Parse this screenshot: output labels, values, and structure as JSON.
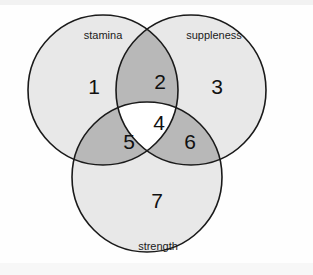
{
  "diagram": {
    "type": "venn-3-set",
    "background_color": "#fefefe",
    "stroke_color": "#1a1a1a",
    "fill_single": "#e8e8e8",
    "fill_double": "#b8b8b8",
    "fill_triple": "#ffffff",
    "sets": [
      {
        "id": "stamina",
        "label": "stamina",
        "cx": 103,
        "cy": 90,
        "r": 75,
        "label_x": 103,
        "label_y": 36
      },
      {
        "id": "suppleness",
        "label": "suppleness",
        "cx": 191,
        "cy": 90,
        "r": 75,
        "label_x": 214,
        "label_y": 36
      },
      {
        "id": "strength",
        "label": "strength",
        "cx": 147,
        "cy": 177,
        "r": 75,
        "label_x": 158,
        "label_y": 247
      }
    ],
    "regions": [
      {
        "id": "stamina-only",
        "number": "1",
        "x": 94,
        "y": 88,
        "shade": "single"
      },
      {
        "id": "stamina-suppleness",
        "number": "2",
        "x": 160,
        "y": 83,
        "shade": "double"
      },
      {
        "id": "suppleness-only",
        "number": "3",
        "x": 217,
        "y": 88,
        "shade": "single"
      },
      {
        "id": "stamina-suppleness-strength",
        "number": "4",
        "x": 159,
        "y": 124,
        "shade": "triple"
      },
      {
        "id": "stamina-strength",
        "number": "5",
        "x": 129,
        "y": 143,
        "shade": "double"
      },
      {
        "id": "suppleness-strength",
        "number": "6",
        "x": 190,
        "y": 143,
        "shade": "double"
      },
      {
        "id": "strength-only",
        "number": "7",
        "x": 157,
        "y": 202,
        "shade": "single"
      }
    ]
  }
}
